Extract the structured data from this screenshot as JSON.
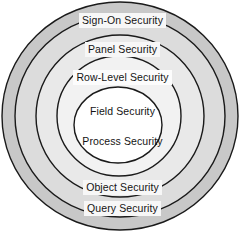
{
  "diagram": {
    "type": "concentric-rings",
    "background_color": "#ffffff",
    "stroke_color": "#1a1a1a",
    "layers": [
      {
        "id": "query-security",
        "label": "Query Security",
        "ring_index": 1,
        "fill": "#c8c8c8",
        "label_position": "bottom"
      },
      {
        "id": "object-security",
        "label": "Object Security",
        "ring_index": 2,
        "fill": "#dcdcdc",
        "label_position": "bottom"
      },
      {
        "id": "sign-on-security",
        "label": "Sign-On Security",
        "ring_index": 2,
        "fill": "#dcdcdc",
        "label_position": "top"
      },
      {
        "id": "panel-security",
        "label": "Panel Security",
        "ring_index": 3,
        "fill": "#e9e9e9",
        "label_position": "top"
      },
      {
        "id": "row-level-security",
        "label": "Row-Level Security",
        "ring_index": 4,
        "fill": "#f2f2f2",
        "label_position": "top"
      },
      {
        "id": "field-security",
        "label": "Field Security",
        "ring_index": 5,
        "fill": "#ffffff",
        "label_position": "center-upper"
      },
      {
        "id": "process-security",
        "label": "Process Security",
        "ring_index": 5,
        "fill": "#ffffff",
        "label_position": "center-lower"
      }
    ],
    "circles": [
      {
        "id": "circle-outer",
        "cx": 120,
        "cy": 116,
        "rx": 118,
        "ry": 114,
        "fill": "#c8c8c8"
      },
      {
        "id": "circle-second",
        "cx": 120,
        "cy": 116,
        "rx": 105,
        "ry": 101,
        "fill": "#dcdcdc"
      },
      {
        "id": "circle-third",
        "cx": 120,
        "cy": 116,
        "rx": 84,
        "ry": 81,
        "fill": "#e9e9e9"
      },
      {
        "id": "circle-fourth",
        "cx": 119,
        "cy": 116,
        "rx": 62,
        "ry": 60,
        "fill": "#f2f2f2"
      },
      {
        "id": "circle-inner",
        "cx": 118,
        "cy": 125,
        "rx": 44,
        "ry": 38,
        "fill": "#ffffff"
      }
    ]
  }
}
